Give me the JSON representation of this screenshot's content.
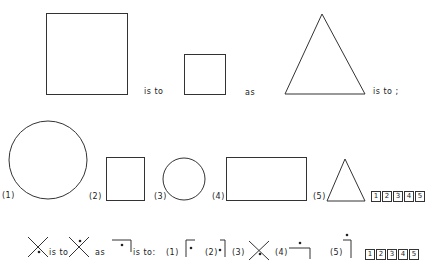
{
  "problem1": {
    "connector1": "is to",
    "connector2": "as",
    "connector3": "is to ;",
    "stem_shapes": [
      "large-square",
      "small-square",
      "large-triangle"
    ],
    "options": [
      {
        "label": "(1)",
        "shape": "large-circle"
      },
      {
        "label": "(2)",
        "shape": "small-square"
      },
      {
        "label": "(3)",
        "shape": "small-circle"
      },
      {
        "label": "(4)",
        "shape": "rectangle"
      },
      {
        "label": "(5)",
        "shape": "small-triangle"
      }
    ],
    "answer_boxes": [
      "1",
      "2",
      "3",
      "4",
      "5"
    ]
  },
  "problem2": {
    "connector1": "is to",
    "connector2": "as",
    "connector3": "is to:",
    "stem_shapes": [
      "x-dot-below",
      "x-dot-above",
      "bracket-dot-below"
    ],
    "options": [
      {
        "label": "(1)",
        "shape": "bracket-left-dot-right"
      },
      {
        "label": "(2)",
        "shape": "bracket-right-dot-left"
      },
      {
        "label": "(3)",
        "shape": "x-dot-below"
      },
      {
        "label": "(4)",
        "shape": "bracket-dot-above"
      },
      {
        "label": "(5)",
        "shape": "vertical-dot-above"
      }
    ],
    "answer_boxes": [
      "1",
      "2",
      "3",
      "4",
      "5"
    ]
  }
}
